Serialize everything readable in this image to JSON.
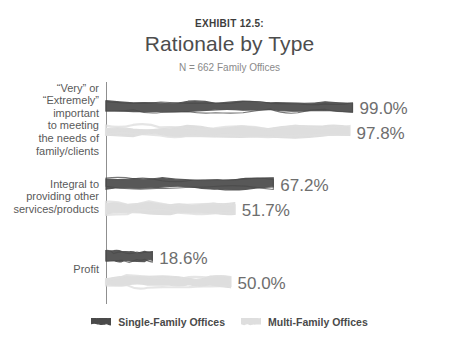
{
  "header": {
    "exhibit_label": "EXHIBIT 12.5:",
    "title": "Rationale by Type",
    "subtitle": "N = 662 Family Offices"
  },
  "colors": {
    "single_family": "#4a4a4a",
    "multi_family": "#dedede",
    "axis": "#8f8f8f",
    "label_text": "#5a5a5a",
    "value_text": "#6e6e6e"
  },
  "legend": {
    "items": [
      {
        "label": "Single-Family Offices",
        "color": "#4a4a4a",
        "swatch": "dark-swatch"
      },
      {
        "label": "Multi-Family Offices",
        "color": "#dedede",
        "swatch": "light-swatch"
      }
    ]
  },
  "chart_data": {
    "type": "bar",
    "orientation": "horizontal",
    "title": "Rationale by Type",
    "subtitle": "N = 662 Family Offices",
    "xlabel": "",
    "ylabel": "",
    "xlim": [
      0,
      100
    ],
    "grid": false,
    "legend_position": "bottom",
    "categories": [
      "“Very” or\n“Extremely”\nimportant\nto meeting\nthe needs of\nfamily/clients",
      "Integral to\nproviding other\nservices/products",
      "Profit"
    ],
    "series": [
      {
        "name": "Single-Family Offices",
        "color": "#4a4a4a",
        "values": [
          99.0,
          67.2,
          18.6
        ],
        "labels": [
          "99.0%",
          "67.2%",
          "18.6%"
        ]
      },
      {
        "name": "Multi-Family Offices",
        "color": "#dedede",
        "values": [
          97.8,
          51.7,
          50.0
        ],
        "labels": [
          "97.8%",
          "51.7%",
          "50.0%"
        ]
      }
    ]
  }
}
